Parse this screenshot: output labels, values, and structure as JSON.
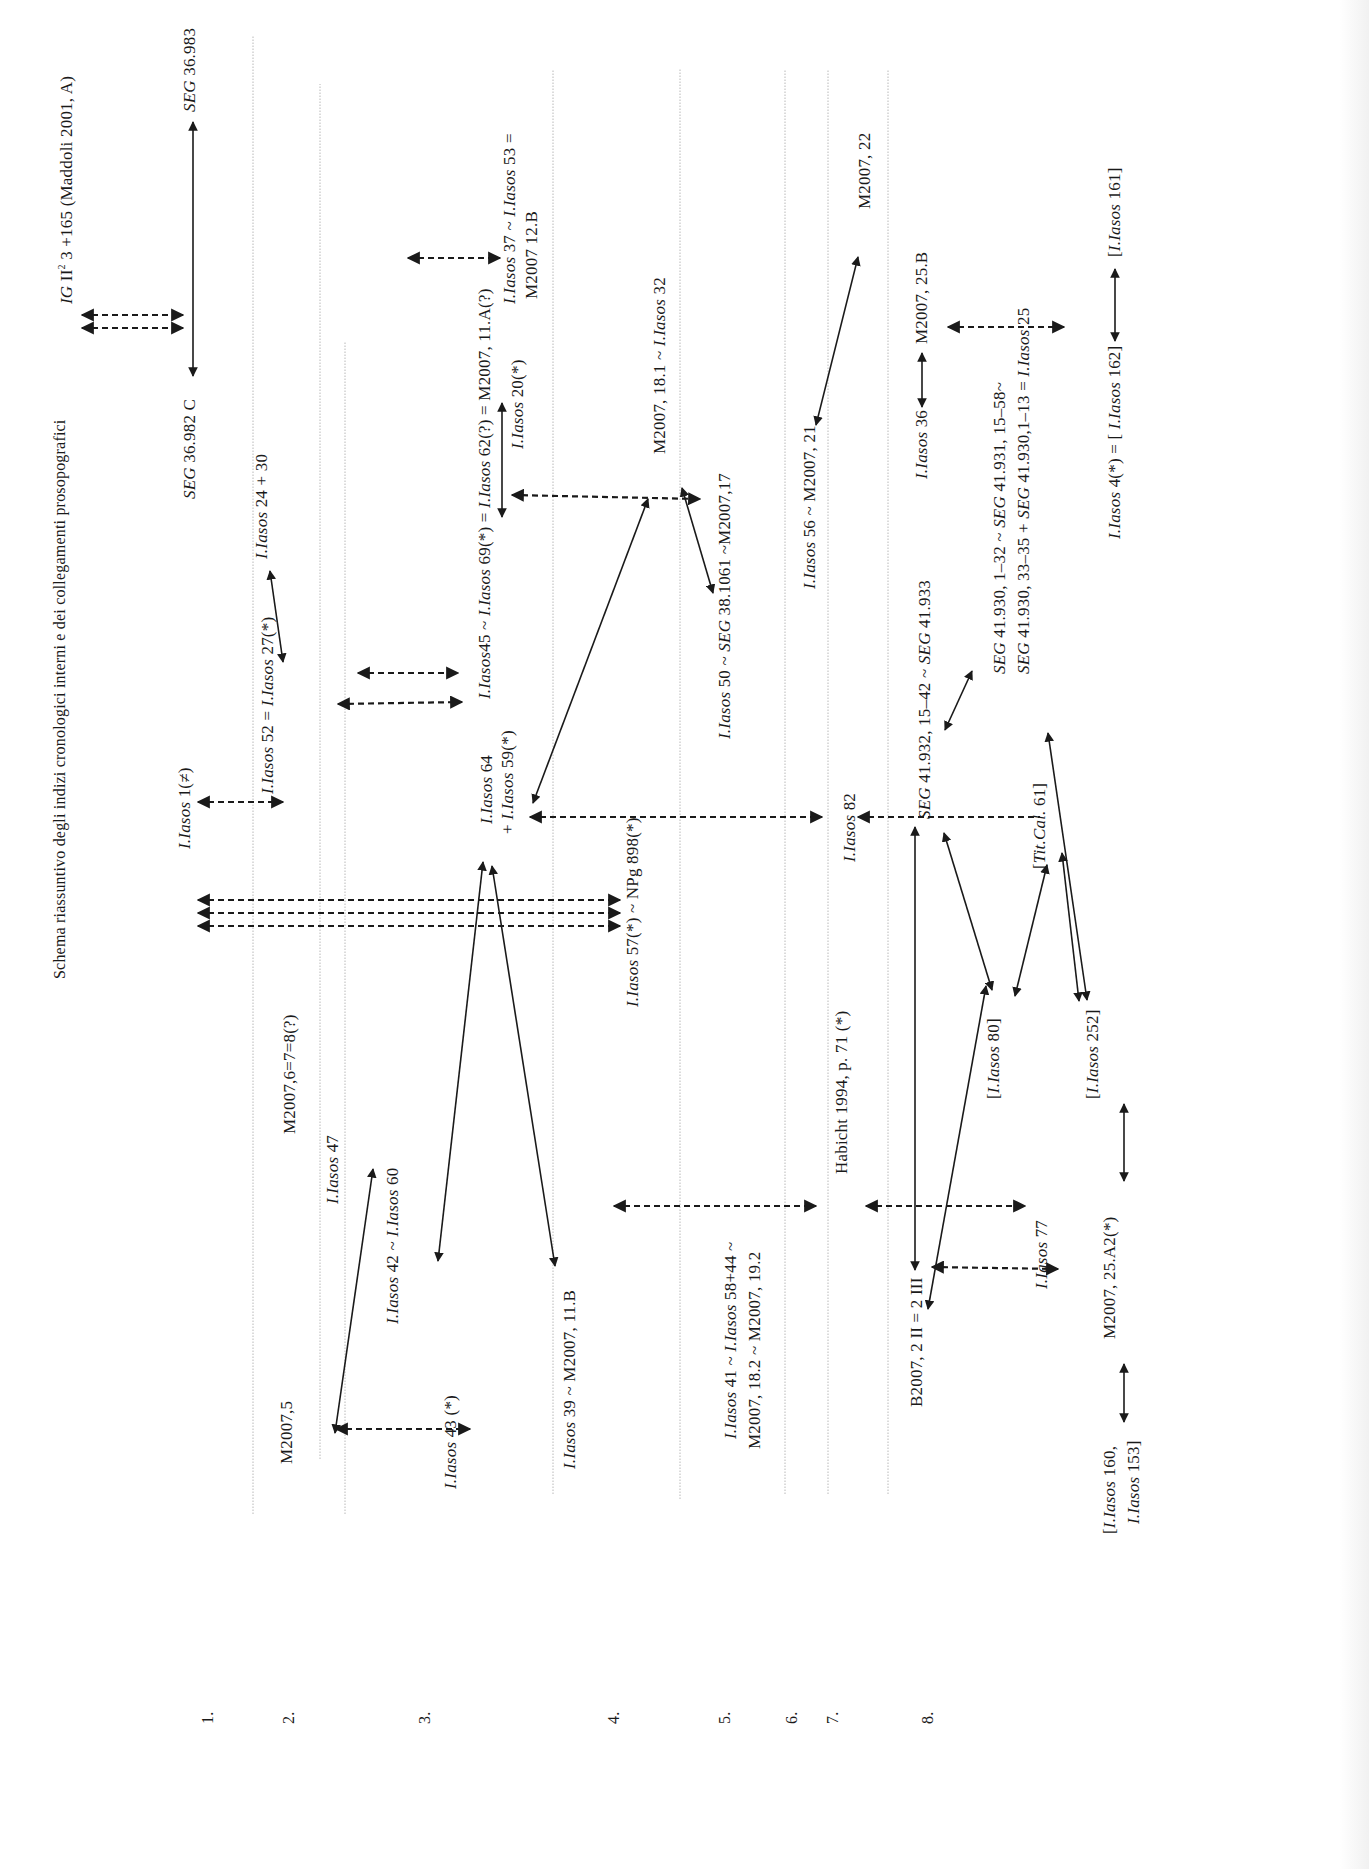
{
  "title": "Schema riassuntivo degli indizi cronologici interni e dei collegamenti prosopografici",
  "rows": [
    {
      "num": "1."
    },
    {
      "num": "2."
    },
    {
      "num": "3."
    },
    {
      "num": "4."
    },
    {
      "num": "5."
    },
    {
      "num": "6."
    },
    {
      "num": "7."
    },
    {
      "num": "8."
    }
  ],
  "nodes": {
    "ig": {
      "it": "IG",
      "rest1": " II",
      "sup": "2",
      "rest2": " 3 +165 (Maddoli 2001, A)"
    },
    "seg36982": {
      "it": "SEG",
      "rest": " 36.982 C"
    },
    "seg36983": {
      "it": "SEG",
      "rest": " 36.983"
    },
    "iasos1": {
      "it": "I.Iasos",
      "rest": " 1(≠)"
    },
    "iasos52": {
      "it1": "I.Iasos",
      "mid": " 52 = ",
      "it2": "I.Iasos",
      "rest": " 27(*)"
    },
    "iasos2430": {
      "it": "I.Iasos",
      "rest": " 24 + 30"
    },
    "m2007_678": {
      "text": "M2007,6=7=8(?)"
    },
    "m2007_5": {
      "text": "M2007,5"
    },
    "iasos47": {
      "it": "I.Iasos",
      "rest": " 47"
    },
    "iasos42": {
      "it1": "I.Iasos",
      "mid": " 42 ~ ",
      "it2": "I.Iasos",
      "rest": " 60"
    },
    "iasos43": {
      "it": "I.Iasos",
      "rest": " 43 (*)"
    },
    "iasos64": {
      "it": "I.Iasos",
      "rest": " 64"
    },
    "iasos59": {
      "pre": "+ ",
      "it": "I.Iasos",
      "rest": " 59(*)"
    },
    "iasos45": {
      "it1": "I.Iasos",
      "mid1": "45 ~ ",
      "it2": "I.Iasos",
      "mid2": " 69(*) = ",
      "it3": "I.Iasos",
      "rest": " 62(?) = M2007, 11.A(?)"
    },
    "iasos37": {
      "it1": "I.Iasos",
      "mid": " 37 ~ ",
      "it2": "I.Iasos",
      "rest": " 53 ="
    },
    "m2007_12b": {
      "text": "M2007 12.B"
    },
    "iasos20": {
      "it": "I.Iasos",
      "rest": " 20(*)"
    },
    "iasos57": {
      "it": "I.Iasos",
      "rest": " 57(*) ~ NPg 898(*)"
    },
    "iasos39": {
      "it": "I.Iasos",
      "rest": " 39 ~ M2007, 11.B"
    },
    "m2007_181": {
      "pre": "M2007, 18.1 ~ ",
      "it": "I.Iasos",
      "rest": " 32"
    },
    "iasos50": {
      "it1": "I.Iasos",
      "mid": " 50 ~ ",
      "it2": "SEG",
      "rest": " 38.1061 ~M2007,17"
    },
    "iasos41_l1": {
      "it1": "I.Iasos",
      "mid": " 41 ~ ",
      "it2": "I.Iasos",
      "rest": " 58+44 ~"
    },
    "iasos41_l2": {
      "text": "M2007, 18.2 ~ M2007, 19.2"
    },
    "iasos56": {
      "it": "I.Iasos",
      "rest": " 56 ~ M2007, 21"
    },
    "m2007_22": {
      "text": "M2007, 22"
    },
    "iasos82": {
      "it": "I.Iasos",
      "rest": " 82"
    },
    "habicht": {
      "text": "Habicht 1994, p. 71 (*)"
    },
    "seg41932": {
      "it1": "SEG",
      "mid": " 41.932, 15–42 ~ ",
      "it2": "SEG",
      "rest": " 41.933"
    },
    "seg41930a": {
      "it1": "SEG",
      "mid": " 41.930, 1–32 ~ ",
      "it2": "SEG",
      "rest": " 41.931, 15–58~"
    },
    "seg41930b": {
      "it1": "SEG",
      "mid1": " 41.930, 33–35 + ",
      "it2": "SEG",
      "mid2": " 41.930,1–13 = ",
      "it3": "I.Iasos",
      "rest": " 25"
    },
    "iasos36": {
      "it": "I.Iasos",
      "rest": " 36"
    },
    "m2007_25b": {
      "text": "M2007, 25.B"
    },
    "iasos4": {
      "it1": "I.Iasos",
      "mid": " 4(*) = [ ",
      "it2": "I.Iasos",
      "rest": " 162]"
    },
    "iasos161": {
      "pre": "[",
      "it": "I.Iasos",
      "rest": " 161]"
    },
    "titcal": {
      "pre": "[",
      "it": "Tit.Cal.",
      "rest": " 61]"
    },
    "iasos80": {
      "pre": "[",
      "it": "I.Iasos",
      "rest": " 80]"
    },
    "iasos252": {
      "pre": "[",
      "it": "I.Iasos",
      "rest": " 252]"
    },
    "iasos77": {
      "it": "I.Iasos",
      "rest": " 77"
    },
    "b2007": {
      "text": "B2007, 2 II = 2 III"
    },
    "m2007_25a2": {
      "text": "M2007, 25.A2(*)"
    },
    "iasos160_l1": {
      "pre": "[",
      "it": "I.Iasos",
      "rest": " 160,"
    },
    "iasos160_l2": {
      "it": "I.Iasos",
      "rest": " 153]"
    }
  },
  "legend": {
    "solid_arrow": "internal chronological link",
    "dashed_arrow": "prosopographical link"
  },
  "colors": {
    "ink": "#1a1a1a",
    "grid": "#b5b5b5",
    "paper": "#ffffff"
  }
}
